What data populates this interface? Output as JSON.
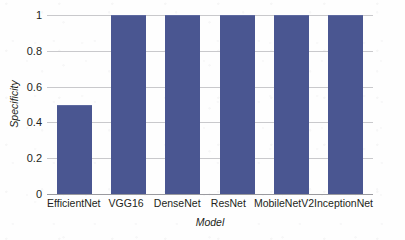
{
  "chart_data": {
    "type": "bar",
    "title": "",
    "xlabel": "Model",
    "ylabel": "Specificity",
    "categories": [
      "EfficientNet",
      "VGG16",
      "DenseNet",
      "ResNet",
      "MobileNetV2",
      "InceptionNet"
    ],
    "values": [
      0.5,
      1,
      1,
      1,
      1,
      1
    ],
    "series": [
      {
        "name": "Specificity",
        "values": [
          0.5,
          1,
          1,
          1,
          1,
          1
        ]
      }
    ],
    "ylim": [
      0,
      1
    ],
    "ytick_labels": [
      "0",
      "0.2",
      "0.4",
      "0.6",
      "0.8",
      "1"
    ],
    "ytick_values": [
      0,
      0.2,
      0.4,
      0.6,
      0.8,
      1
    ],
    "grid": "horizontal",
    "legend": "none",
    "bar_color": "#4a5691",
    "gridline_color": "#c9c9cc",
    "axis_color": "#9a9a9f",
    "text_color": "#231f20"
  }
}
